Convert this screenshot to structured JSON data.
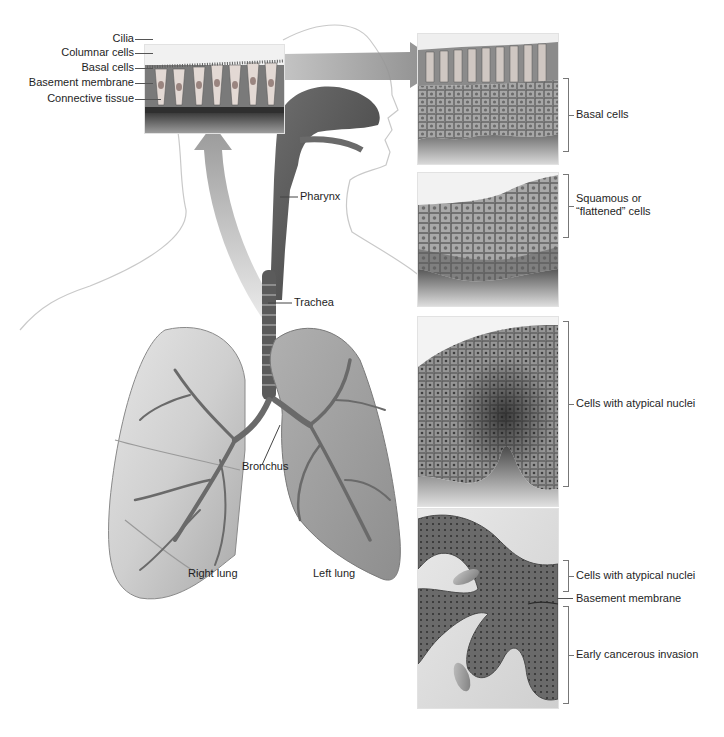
{
  "figure": {
    "colors": {
      "background": "#ffffff",
      "tissue_dark": "#4a4a4a",
      "tissue_mid": "#8a8a8a",
      "tissue_light": "#cfcfcf",
      "arrow": "#9a9a9a",
      "outline": "#b8b8b8"
    }
  },
  "normal_epithelium": {
    "labels": [
      {
        "text": "Cilia"
      },
      {
        "text": "Columnar cells"
      },
      {
        "text": "Basal cells"
      },
      {
        "text": "Basement membrane"
      },
      {
        "text": "Connective tissue"
      }
    ]
  },
  "anatomy": {
    "labels": {
      "pharynx": "Pharynx",
      "trachea": "Trachea",
      "bronchus": "Bronchus",
      "right_lung": "Right lung",
      "left_lung": "Left lung"
    }
  },
  "stages": [
    {
      "id": "stage-1",
      "labels": [
        {
          "text": "Basal cells"
        }
      ]
    },
    {
      "id": "stage-2",
      "labels": [
        {
          "text": "Squamous or"
        },
        {
          "text": "“flattened” cells"
        }
      ]
    },
    {
      "id": "stage-3",
      "labels": [
        {
          "text": "Cells with atypical nuclei"
        }
      ]
    },
    {
      "id": "stage-4",
      "labels": [
        {
          "text": "Cells with atypical nuclei"
        },
        {
          "text": "Basement membrane"
        },
        {
          "text": "Early cancerous invasion"
        }
      ]
    }
  ]
}
